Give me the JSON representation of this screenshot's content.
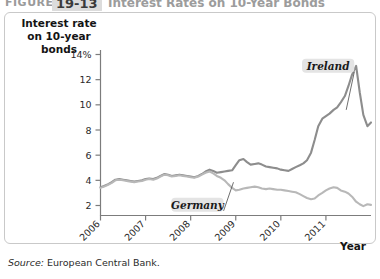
{
  "figure": {
    "label_word": "FIGURE",
    "number": "19-13",
    "title": "Interest Rates on 10-Year Bonds",
    "source_word": "Source:",
    "source_text": " European Central Bank."
  },
  "chart_data": {
    "type": "line",
    "title": "Interest Rates on 10-Year Bonds",
    "ylabel": "Interest rate on 10-year bonds",
    "xlabel": "Year",
    "ylim": [
      0,
      14
    ],
    "xlim": [
      2006.0,
      2012.0
    ],
    "yticks": [
      "2",
      "4",
      "6",
      "8",
      "10",
      "12",
      "14%"
    ],
    "ytick_values": [
      2,
      4,
      6,
      8,
      10,
      12,
      14
    ],
    "xticks": [
      "2006",
      "2007",
      "2008",
      "2009",
      "2010",
      "2011"
    ],
    "xtick_values": [
      2006,
      2007,
      2008,
      2009,
      2010,
      2011
    ],
    "grid": false,
    "legend": "inline-annotations",
    "annotations": [
      {
        "name": "Ireland",
        "label_x": 2011.05,
        "label_y": 13.1,
        "point_x": 2011.45,
        "point_y": 9.6
      },
      {
        "name": "Germany",
        "label_x": 2008.15,
        "label_y": 2.05,
        "point_x": 2008.95,
        "point_y": 3.85
      }
    ],
    "series": [
      {
        "name": "Ireland",
        "color": "#8d8d8d",
        "x": [
          2006.0,
          2006.08,
          2006.17,
          2006.25,
          2006.33,
          2006.42,
          2006.5,
          2006.58,
          2006.67,
          2006.75,
          2006.83,
          2006.92,
          2007.0,
          2007.08,
          2007.17,
          2007.25,
          2007.33,
          2007.42,
          2007.5,
          2007.58,
          2007.67,
          2007.75,
          2007.83,
          2007.92,
          2008.0,
          2008.08,
          2008.17,
          2008.25,
          2008.33,
          2008.42,
          2008.5,
          2008.58,
          2008.67,
          2008.75,
          2008.83,
          2008.92,
          2009.0,
          2009.08,
          2009.17,
          2009.25,
          2009.33,
          2009.42,
          2009.5,
          2009.58,
          2009.67,
          2009.75,
          2009.83,
          2009.92,
          2010.0,
          2010.08,
          2010.17,
          2010.25,
          2010.33,
          2010.42,
          2010.5,
          2010.58,
          2010.67,
          2010.75,
          2010.83,
          2010.92,
          2011.0,
          2011.08,
          2011.17,
          2011.25,
          2011.33,
          2011.42,
          2011.5,
          2011.58,
          2011.67,
          2011.75,
          2011.83,
          2011.92,
          2012.0
        ],
        "y": [
          3.45,
          3.55,
          3.7,
          3.85,
          4.05,
          4.1,
          4.05,
          4.0,
          3.95,
          3.9,
          3.95,
          4.0,
          4.1,
          4.15,
          4.1,
          4.2,
          4.35,
          4.5,
          4.45,
          4.35,
          4.4,
          4.45,
          4.4,
          4.35,
          4.3,
          4.25,
          4.35,
          4.5,
          4.7,
          4.85,
          4.75,
          4.6,
          4.65,
          4.7,
          4.75,
          4.8,
          5.2,
          5.6,
          5.7,
          5.45,
          5.25,
          5.3,
          5.35,
          5.25,
          5.1,
          5.05,
          5.0,
          4.95,
          4.85,
          4.8,
          4.75,
          4.9,
          5.05,
          5.2,
          5.35,
          5.6,
          6.2,
          7.2,
          8.3,
          8.9,
          9.1,
          9.3,
          9.6,
          9.8,
          10.2,
          10.7,
          11.5,
          12.4,
          13.1,
          11.0,
          9.2,
          8.3,
          8.6
        ]
      },
      {
        "name": "Germany",
        "color": "#b8b8b8",
        "x": [
          2006.0,
          2006.08,
          2006.17,
          2006.25,
          2006.33,
          2006.42,
          2006.5,
          2006.58,
          2006.67,
          2006.75,
          2006.83,
          2006.92,
          2007.0,
          2007.08,
          2007.17,
          2007.25,
          2007.33,
          2007.42,
          2007.5,
          2007.58,
          2007.67,
          2007.75,
          2007.83,
          2007.92,
          2008.0,
          2008.08,
          2008.17,
          2008.25,
          2008.33,
          2008.42,
          2008.5,
          2008.58,
          2008.67,
          2008.75,
          2008.83,
          2008.92,
          2009.0,
          2009.08,
          2009.17,
          2009.25,
          2009.33,
          2009.42,
          2009.5,
          2009.58,
          2009.67,
          2009.75,
          2009.83,
          2009.92,
          2010.0,
          2010.08,
          2010.17,
          2010.25,
          2010.33,
          2010.42,
          2010.5,
          2010.58,
          2010.67,
          2010.75,
          2010.83,
          2010.92,
          2011.0,
          2011.08,
          2011.17,
          2011.25,
          2011.33,
          2011.42,
          2011.5,
          2011.58,
          2011.67,
          2011.75,
          2011.83,
          2011.92,
          2012.0
        ],
        "y": [
          3.4,
          3.5,
          3.65,
          3.8,
          4.0,
          4.05,
          4.0,
          3.95,
          3.9,
          3.85,
          3.9,
          3.95,
          4.05,
          4.1,
          4.05,
          4.15,
          4.3,
          4.45,
          4.4,
          4.3,
          4.35,
          4.4,
          4.35,
          4.3,
          4.25,
          4.2,
          4.3,
          4.45,
          4.6,
          4.7,
          4.55,
          4.35,
          4.2,
          4.0,
          3.7,
          3.4,
          3.2,
          3.25,
          3.35,
          3.4,
          3.45,
          3.5,
          3.45,
          3.35,
          3.3,
          3.35,
          3.3,
          3.25,
          3.25,
          3.2,
          3.15,
          3.1,
          3.05,
          2.9,
          2.75,
          2.6,
          2.5,
          2.55,
          2.8,
          3.0,
          3.2,
          3.35,
          3.45,
          3.4,
          3.2,
          3.1,
          2.95,
          2.7,
          2.3,
          2.1,
          1.95,
          2.1,
          2.05
        ]
      }
    ]
  }
}
